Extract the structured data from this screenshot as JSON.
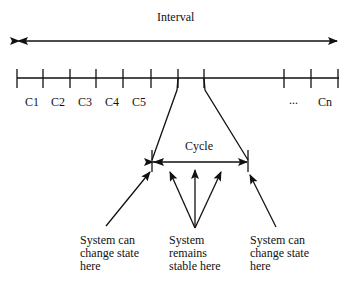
{
  "diagram": {
    "interval_label": "Interval",
    "timeline": {
      "cycle_labels": [
        {
          "label": "C1",
          "x": 30
        },
        {
          "label": "C2",
          "x": 57
        },
        {
          "label": "C3",
          "x": 83
        },
        {
          "label": "C4",
          "x": 110
        },
        {
          "label": "C5",
          "x": 136
        },
        {
          "label": "...",
          "x": 290
        },
        {
          "label": "Cn",
          "x": 318
        }
      ]
    },
    "cycle_label": "Cycle",
    "annotations": [
      {
        "lines": [
          "System can",
          "change state",
          "here"
        ]
      },
      {
        "lines": [
          "System",
          "remains",
          "stable here"
        ]
      },
      {
        "lines": [
          "System can",
          "change state",
          "here"
        ]
      }
    ],
    "colors": {
      "ink": "#111111",
      "background": "#ffffff"
    }
  }
}
